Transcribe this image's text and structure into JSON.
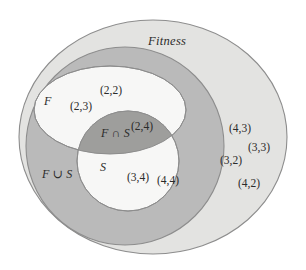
{
  "figure": {
    "universe_label": "Fitness",
    "union_label": "F ∪ S",
    "intersection_label": "F ∩ S",
    "set_f_label": "F",
    "set_s_label": "S"
  },
  "colors": {
    "background": "#ffffff",
    "universe_fill": "#e3e3e1",
    "union_fill": "#bababa",
    "intersection_fill": "#9e9e9c",
    "set_fill": "#f7f7f6",
    "stroke": "#8d8d8d",
    "text": "#2b2b2b"
  },
  "regions": {
    "set_f_only": {
      "name": "F only",
      "points": [
        "(2,2)",
        "(2,3)"
      ]
    },
    "intersection": {
      "name": "F ∩ S",
      "points": [
        "(2,4)"
      ]
    },
    "set_s_only": {
      "name": "S only",
      "points": [
        "(3,4)",
        "(4,4)"
      ]
    },
    "outside_union": {
      "name": "Fitness outside F ∪ S",
      "points": [
        "(4,3)",
        "(3,3)",
        "(3,2)",
        "(4,2)"
      ]
    }
  },
  "point_positions": [
    {
      "text": "(2,2)",
      "x": 100,
      "y": 85,
      "region": "set_f_only"
    },
    {
      "text": "(2,3)",
      "x": 70,
      "y": 101,
      "region": "set_f_only"
    },
    {
      "text": "(2,4)",
      "x": 131,
      "y": 121,
      "region": "intersection"
    },
    {
      "text": "(3,4)",
      "x": 127,
      "y": 172,
      "region": "set_s_only"
    },
    {
      "text": "(4,4)",
      "x": 157,
      "y": 175,
      "region": "set_s_only"
    },
    {
      "text": "(4,3)",
      "x": 229,
      "y": 123,
      "region": "outside_union"
    },
    {
      "text": "(3,3)",
      "x": 248,
      "y": 142,
      "region": "outside_union"
    },
    {
      "text": "(3,2)",
      "x": 220,
      "y": 155,
      "region": "outside_union"
    },
    {
      "text": "(4,2)",
      "x": 238,
      "y": 178,
      "region": "outside_union"
    }
  ]
}
